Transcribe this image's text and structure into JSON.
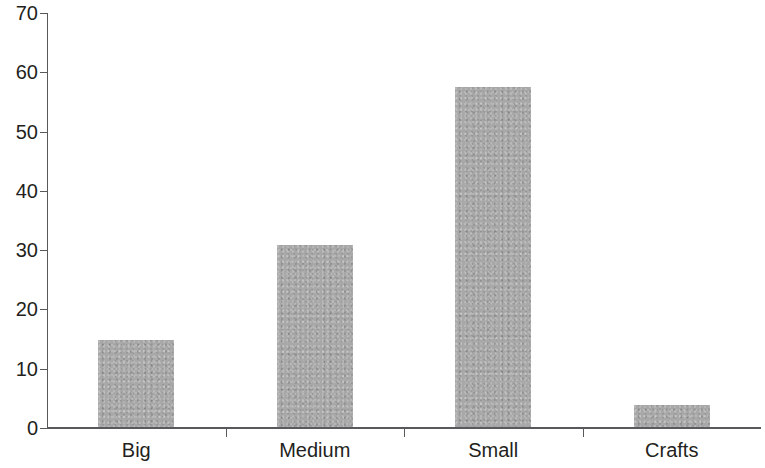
{
  "chart_data": {
    "type": "bar",
    "title": "",
    "subtitle": "",
    "xlabel": "",
    "ylabel": "",
    "categories": [
      "Big",
      "Medium",
      "Small",
      "Crafts"
    ],
    "values": [
      14.8,
      30.8,
      57.6,
      3.9
    ],
    "series": [
      {
        "name": "",
        "values": [
          14.8,
          30.8,
          57.6,
          3.9
        ]
      }
    ],
    "ylim": [
      0,
      70
    ],
    "yticks": [
      0,
      10,
      20,
      30,
      40,
      50,
      60,
      70
    ],
    "ytick_labels": [
      "0",
      "10",
      "20",
      "30",
      "40",
      "50",
      "60",
      "70"
    ],
    "grid": false,
    "legend": false,
    "legend_position": "none",
    "annotations": [],
    "bar_color": "#a8a8a8",
    "axis_color": "#58595b",
    "text_color": "#231f20",
    "background_color": "#ffffff"
  }
}
